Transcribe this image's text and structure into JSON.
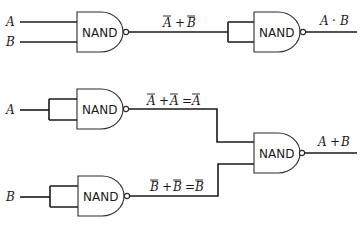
{
  "diagram": {
    "gate_label": "NAND",
    "inputs": {
      "top_a": "A",
      "top_b": "B",
      "mid_a": "A",
      "bot_b": "B"
    },
    "circuit_and": {
      "intermediate": {
        "parts": [
          "A",
          "+",
          "B"
        ],
        "bars": [
          true,
          false,
          true
        ]
      },
      "output": {
        "parts": [
          "A",
          "·",
          "B"
        ]
      }
    },
    "circuit_or": {
      "upper_intermediate": {
        "parts": [
          "A",
          "+",
          "A",
          "=",
          "A"
        ],
        "bars": [
          true,
          false,
          true,
          false,
          true
        ]
      },
      "lower_intermediate": {
        "parts": [
          "B",
          "+",
          "B",
          "=",
          "B"
        ],
        "bars": [
          true,
          false,
          true,
          false,
          true
        ]
      },
      "output": {
        "parts": [
          "A",
          "+",
          "B"
        ]
      }
    },
    "colors": {
      "line": "#1a1a1a",
      "background": "#ffffff"
    }
  }
}
